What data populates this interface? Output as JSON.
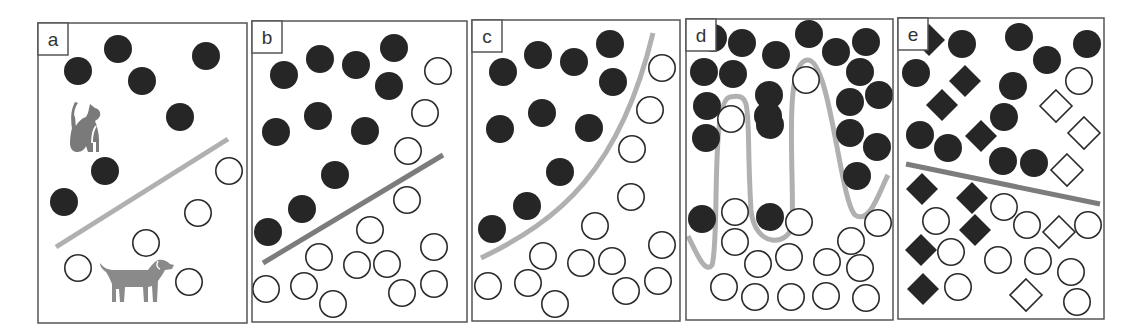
{
  "figure": {
    "width": 1139,
    "height": 335,
    "colors": {
      "filled": "#262626",
      "outline": "#2a2a2a",
      "frame": "#555555",
      "animal": "#7a7a7a",
      "boundary_light": "#b0b0b0",
      "boundary_dark": "#7c7c7c"
    },
    "r": 14,
    "panels": [
      {
        "label": "a",
        "frame": [
          38,
          23,
          209,
          300
        ],
        "filled": [
          [
            78,
            71
          ],
          [
            118,
            49
          ],
          [
            142,
            81
          ],
          [
            206,
            56
          ],
          [
            180,
            117
          ],
          [
            105,
            171
          ],
          [
            64,
            202
          ]
        ],
        "empty": [
          [
            229,
            171
          ],
          [
            198,
            213
          ],
          [
            146,
            243
          ],
          [
            78,
            268
          ],
          [
            189,
            282
          ]
        ],
        "boundary": {
          "d": "M56,247 L228,139",
          "color": "boundary_light",
          "width": 5
        },
        "icons": [
          "cat-icon",
          "dog-icon"
        ]
      },
      {
        "label": "b",
        "frame": [
          252,
          21,
          215,
          301
        ],
        "filled": [
          [
            284,
            75
          ],
          [
            320,
            59
          ],
          [
            356,
            65
          ],
          [
            394,
            48
          ],
          [
            389,
            86
          ],
          [
            318,
            116
          ],
          [
            276,
            132
          ],
          [
            365,
            131
          ],
          [
            335,
            175
          ],
          [
            302,
            209
          ],
          [
            268,
            232
          ]
        ],
        "empty": [
          [
            438,
            71
          ],
          [
            425,
            113
          ],
          [
            408,
            151
          ],
          [
            407,
            200
          ],
          [
            370,
            230
          ],
          [
            319,
            257
          ],
          [
            357,
            265
          ],
          [
            387,
            264
          ],
          [
            434,
            247
          ],
          [
            266,
            289
          ],
          [
            304,
            286
          ],
          [
            333,
            304
          ],
          [
            402,
            293
          ],
          [
            434,
            284
          ]
        ],
        "boundary": {
          "d": "M263,263 L443,155",
          "color": "boundary_dark",
          "width": 5
        }
      },
      {
        "label": "c",
        "frame": [
          472,
          20,
          208,
          301
        ],
        "filled": [
          [
            503,
            72
          ],
          [
            538,
            55
          ],
          [
            574,
            62
          ],
          [
            610,
            44
          ],
          [
            613,
            82
          ],
          [
            542,
            113
          ],
          [
            500,
            129
          ],
          [
            589,
            128
          ],
          [
            560,
            172
          ],
          [
            527,
            206
          ],
          [
            492,
            229
          ]
        ],
        "empty": [
          [
            662,
            68
          ],
          [
            650,
            110
          ],
          [
            632,
            149
          ],
          [
            631,
            197
          ],
          [
            595,
            226
          ],
          [
            543,
            256
          ],
          [
            581,
            263
          ],
          [
            612,
            261
          ],
          [
            662,
            245
          ],
          [
            488,
            286
          ],
          [
            528,
            283
          ],
          [
            555,
            304
          ],
          [
            626,
            291
          ],
          [
            658,
            281
          ]
        ],
        "boundary": {
          "d": "M481,258 C560,220 620,170 653,33",
          "color": "boundary_light",
          "width": 5
        }
      },
      {
        "label": "d",
        "frame": [
          686,
          19,
          207,
          301
        ],
        "filled": [
          [
            713,
            38
          ],
          [
            742,
            43
          ],
          [
            776,
            55
          ],
          [
            809,
            34
          ],
          [
            836,
            52
          ],
          [
            866,
            42
          ],
          [
            704,
            72
          ],
          [
            733,
            74
          ],
          [
            769,
            95
          ],
          [
            860,
            72
          ],
          [
            707,
            106
          ],
          [
            768,
            116
          ],
          [
            850,
            102
          ],
          [
            879,
            95
          ],
          [
            706,
            138
          ],
          [
            770,
            125
          ],
          [
            850,
            133
          ],
          [
            877,
            147
          ],
          [
            857,
            176
          ],
          [
            702,
            219
          ],
          [
            770,
            217
          ]
        ],
        "empty": [
          [
            806,
            80
          ],
          [
            731,
            119
          ],
          [
            735,
            212
          ],
          [
            735,
            242
          ],
          [
            799,
            222
          ],
          [
            758,
            264
          ],
          [
            789,
            257
          ],
          [
            827,
            262
          ],
          [
            851,
            241
          ],
          [
            878,
            223
          ],
          [
            724,
            287
          ],
          [
            755,
            297
          ],
          [
            791,
            297
          ],
          [
            826,
            296
          ],
          [
            866,
            298
          ],
          [
            860,
            268
          ]
        ],
        "boundary": {
          "d": "M688,236 C695,250 705,275 712,265 C720,240 710,100 730,97 C755,92 745,110 751,210 C755,250 790,245 792,225 C795,180 782,60 808,60 C830,60 840,200 855,215 C870,225 880,190 888,175",
          "color": "boundary_light",
          "width": 5
        }
      },
      {
        "label": "e",
        "frame": [
          898,
          18,
          206,
          301
        ],
        "filled": [
          [
            962,
            44
          ],
          [
            1019,
            37
          ],
          [
            1047,
            60
          ],
          [
            1087,
            44
          ],
          [
            916,
            73
          ],
          [
            1013,
            86
          ],
          [
            1004,
            117
          ],
          [
            920,
            135
          ],
          [
            948,
            148
          ],
          [
            1003,
            161
          ],
          [
            1034,
            163
          ]
        ],
        "filled_diamonds": [
          [
            929,
            40
          ],
          [
            965,
            81
          ],
          [
            942,
            105
          ],
          [
            981,
            136
          ],
          [
            922,
            189
          ],
          [
            972,
            198
          ],
          [
            975,
            230
          ],
          [
            921,
            250
          ],
          [
            923,
            289
          ]
        ],
        "empty": [
          [
            1079,
            81
          ],
          [
            1004,
            207
          ],
          [
            936,
            221
          ],
          [
            1027,
            225
          ],
          [
            1088,
            225
          ],
          [
            951,
            252
          ],
          [
            998,
            260
          ],
          [
            1038,
            261
          ],
          [
            1071,
            272
          ],
          [
            958,
            287
          ],
          [
            1077,
            302
          ]
        ],
        "empty_diamonds": [
          [
            1056,
            106
          ],
          [
            1084,
            133
          ],
          [
            1067,
            170
          ],
          [
            1059,
            232
          ],
          [
            1026,
            295
          ]
        ],
        "boundary": {
          "d": "M906,164 L1100,204",
          "color": "boundary_dark",
          "width": 5
        }
      }
    ]
  }
}
